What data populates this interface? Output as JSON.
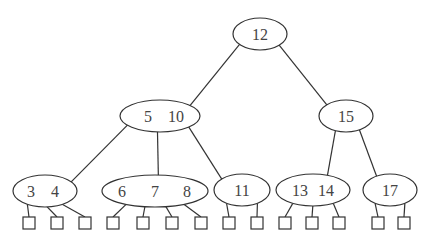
{
  "diagram": {
    "type": "b-tree",
    "nodes": [
      {
        "id": "n12",
        "keys": [
          "12"
        ]
      },
      {
        "id": "n5_10",
        "keys": [
          "5",
          "10"
        ]
      },
      {
        "id": "n15",
        "keys": [
          "15"
        ]
      },
      {
        "id": "n3_4",
        "keys": [
          "3",
          "4"
        ]
      },
      {
        "id": "n6_7_8",
        "keys": [
          "6",
          "7",
          "8"
        ]
      },
      {
        "id": "n11",
        "keys": [
          "11"
        ]
      },
      {
        "id": "n13_14",
        "keys": [
          "13",
          "14"
        ]
      },
      {
        "id": "n17",
        "keys": [
          "17"
        ]
      }
    ],
    "edges": [
      [
        "n12",
        "n5_10"
      ],
      [
        "n12",
        "n15"
      ],
      [
        "n5_10",
        "n3_4"
      ],
      [
        "n5_10",
        "n6_7_8"
      ],
      [
        "n5_10",
        "n11"
      ],
      [
        "n15",
        "n13_14"
      ],
      [
        "n15",
        "n17"
      ]
    ],
    "leaf_counts": {
      "n3_4": 3,
      "n6_7_8": 4,
      "n11": 2,
      "n13_14": 3,
      "n17": 2
    }
  }
}
